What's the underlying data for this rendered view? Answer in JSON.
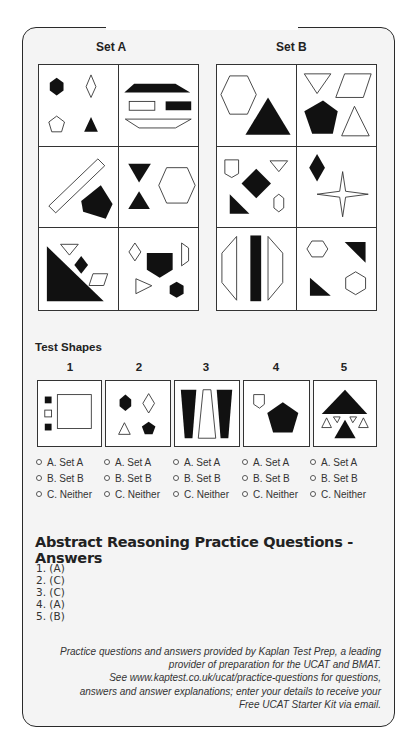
{
  "sets": {
    "a": {
      "title": "Set A"
    },
    "b": {
      "title": "Set B"
    }
  },
  "set_a_cells": [
    "black hexagon, outline diamond, outline pentagon, black triangle",
    "black trapezoid, outline rectangle, black rectangle, outline inverted trapezoid",
    "outline diagonal rectangle, black irregular pentagon",
    "black down triangle, black up triangle, outline hexagon",
    "black right triangle, outline down triangle, black diamond, outline parallelogram",
    "outline diamond, black pentagon, outline trapezoid, outline triangle, black hexagon"
  ],
  "set_b_cells": [
    "outline hexagon, black triangle",
    "outline down triangle, outline parallelogram, black pentagon, outline triangle",
    "outline pentagon, outline down triangle, black diamond, black right triangle, outline hexagon",
    "black diamond, outline four-point star",
    "outline half-octagon left, black bar, outline half-octagon right",
    "outline hexagon, black right triangle, black right triangle, outline hexagon"
  ],
  "test_shapes": {
    "title": "Test Shapes",
    "items": [
      {
        "number": "1",
        "description": "three small squares (black, outline, black), large outline square"
      },
      {
        "number": "2",
        "description": "black hexagon, outline diamond, outline triangle, black pentagon"
      },
      {
        "number": "3",
        "description": "black trapezoid, outline trapezoid, black trapezoid"
      },
      {
        "number": "4",
        "description": "outline pentagon, black pentagon"
      },
      {
        "number": "5",
        "description": "black triangle, outline triangles, black triangle"
      }
    ]
  },
  "options": [
    [
      "A. Set A",
      "B. Set B",
      "C. Neither"
    ],
    [
      "A. Set A",
      "B. Set B",
      "C. Neither"
    ],
    [
      "A. Set A",
      "B. Set B",
      "C. Neither"
    ],
    [
      "A. Set A",
      "B. Set B",
      "C. Neither"
    ],
    [
      "A. Set A",
      "B. Set B",
      "C. Neither"
    ]
  ],
  "answers": {
    "title": "Abstract Reasoning Practice Questions - Answers",
    "items": [
      "1. (A)",
      "2. (C)",
      "3. (C)",
      "4. (A)",
      "5. (B)"
    ]
  },
  "footer": {
    "lines": [
      "Practice questions and answers provided by Kaplan Test Prep, a leading",
      "provider of preparation for the UCAT and BMAT.",
      "See www.kaptest.co.uk/ucat/practice-questions for questions,",
      "answers and answer explanations; enter your details to receive your",
      "Free UCAT Starter Kit via email."
    ]
  },
  "colors": {
    "frame_bg": "#f4f4f4",
    "ink": "#111111",
    "border": "#333333"
  }
}
